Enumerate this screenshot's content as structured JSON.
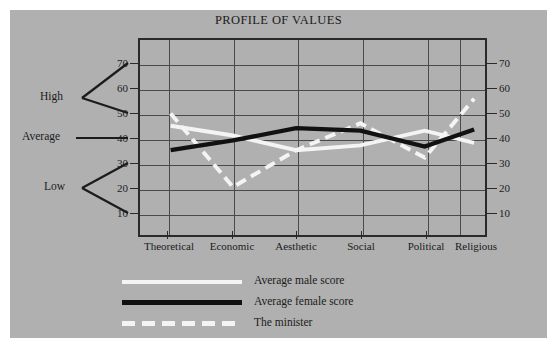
{
  "figure": {
    "background_color": "#b0b0b0",
    "page_background_color": "#ffffff",
    "border_color": "#2a2a2a"
  },
  "chart_data": {
    "type": "line",
    "title": "PROFILE OF VALUES",
    "xlabel": "",
    "ylabel": "",
    "categories": [
      "Theoretical",
      "Economic",
      "Aesthetic",
      "Social",
      "Political",
      "Religious"
    ],
    "ylim": [
      0,
      75
    ],
    "yticks": [
      10,
      20,
      30,
      40,
      50,
      60,
      70
    ],
    "ytick_labels_left": [
      "70",
      "60",
      "50",
      "40",
      "30",
      "20",
      "10"
    ],
    "ytick_labels_right": [
      "70",
      "60",
      "50",
      "40",
      "30",
      "20",
      "10"
    ],
    "grid": true,
    "legend_position": "below",
    "series": [
      {
        "name": "Average male score",
        "style": "solid",
        "color": "#f4f4f4",
        "values": [
          45,
          41,
          35,
          37,
          43,
          38
        ]
      },
      {
        "name": "Average female score",
        "style": "solid",
        "color": "#111111",
        "values": [
          35,
          39,
          44,
          43,
          36.5,
          43.5
        ]
      },
      {
        "name": "The minister",
        "style": "dashed",
        "color": "#f4f4f4",
        "values": [
          50,
          20,
          35,
          46,
          32,
          56
        ]
      }
    ],
    "annotations": [
      {
        "label": "High",
        "kind": "bracket",
        "range": [
          50,
          70
        ]
      },
      {
        "label": "Average",
        "kind": "pointer",
        "range": [
          40,
          40
        ]
      },
      {
        "label": "Low",
        "kind": "bracket",
        "range": [
          10,
          30
        ]
      }
    ]
  },
  "legend": {
    "items": [
      {
        "label": "Average male score",
        "swatch": "solid-white"
      },
      {
        "label": "Average female score",
        "swatch": "solid-black"
      },
      {
        "label": "The minister",
        "swatch": "dashed-white"
      }
    ]
  }
}
